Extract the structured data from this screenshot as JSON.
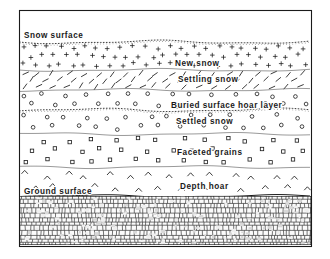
{
  "figure": {
    "type": "snowpack-stratigraphy-cross-section",
    "frame": {
      "x": 19,
      "y": 10,
      "width": 292,
      "height": 236,
      "border_color": "#1a1a1a"
    },
    "background_color": "#ffffff",
    "ink_color": "#1a1a1a"
  },
  "boundaries": [
    {
      "id": "snow-surface",
      "label": "Snow surface",
      "label_x": 24,
      "label_y": 38,
      "line_y": 42,
      "line_style": "stippled-wavy",
      "anchor": "start"
    },
    {
      "id": "buried-surface-hoar-layer",
      "label": "Buried  surface  hoar  layer",
      "label_x": 171,
      "label_y": 108,
      "line_y": 110,
      "line_style": "stippled-wavy",
      "anchor": "start"
    },
    {
      "id": "ground-surface",
      "label": "Ground surface",
      "label_x": 24,
      "label_y": 194,
      "line_y": 196,
      "line_style": "solid",
      "anchor": "start"
    }
  ],
  "layers": [
    {
      "id": "new-snow",
      "label": "New  snow",
      "label_x": 175,
      "label_y": 66,
      "top": 42,
      "bottom": 70,
      "symbol": "plus",
      "symbol_rows": 3,
      "symbol_cols": 24
    },
    {
      "id": "settling-snow",
      "label": "Settling  snow",
      "label_x": 178,
      "label_y": 82,
      "top": 70,
      "bottom": 90,
      "symbol": "slash",
      "symbol_rows": 3,
      "symbol_cols": 20
    },
    {
      "id": "settled-snow-upper",
      "label": "",
      "label_x": 0,
      "label_y": 0,
      "top": 90,
      "bottom": 110,
      "symbol": "circle",
      "symbol_rows": 2,
      "symbol_cols": 14
    },
    {
      "id": "settled-snow",
      "label": "Settled  snow",
      "label_x": 176,
      "label_y": 124,
      "top": 110,
      "bottom": 134,
      "symbol": "circle",
      "symbol_rows": 2,
      "symbol_cols": 14
    },
    {
      "id": "faceted-grains",
      "label": "Faceted   grains",
      "label_x": 177,
      "label_y": 155,
      "top": 134,
      "bottom": 167,
      "symbol": "square",
      "symbol_rows": 3,
      "symbol_cols": 13
    },
    {
      "id": "depth-hoar",
      "label": "Depth  hoar",
      "label_x": 180,
      "label_y": 189,
      "top": 167,
      "bottom": 196,
      "symbol": "chevron",
      "symbol_rows": 2,
      "symbol_cols": 14
    },
    {
      "id": "ground",
      "label": "",
      "label_x": 0,
      "label_y": 0,
      "top": 196,
      "bottom": 245,
      "symbol": "blocky-ground",
      "symbol_rows": 0,
      "symbol_cols": 0
    }
  ]
}
